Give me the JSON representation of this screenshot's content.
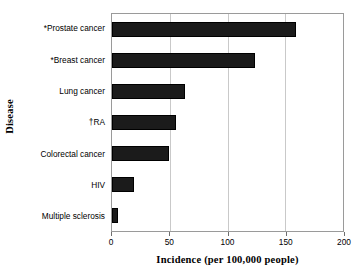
{
  "chart_data": {
    "type": "bar",
    "orientation": "horizontal",
    "title": "",
    "xlabel": "Incidence (per 100,000 people)",
    "ylabel": "Disease",
    "categories": [
      "Multiple sclerosis",
      "HIV",
      "Colorectal cancer",
      "†RA",
      "Lung cancer",
      "*Breast cancer",
      "*Prostate cancer"
    ],
    "values": [
      5,
      19,
      49,
      55,
      63,
      124,
      159
    ],
    "xlim": [
      0,
      200
    ],
    "xticks": [
      0,
      50,
      100,
      150,
      200
    ],
    "xtick_labels": [
      "0",
      "50",
      "100",
      "150",
      "200"
    ],
    "gridlines": [
      50,
      100,
      150
    ],
    "grid": true,
    "legend": "none",
    "bar_color": "#1b1b1b",
    "axis_color": "#9a9a9a",
    "grid_color": "#c9c9c9"
  }
}
